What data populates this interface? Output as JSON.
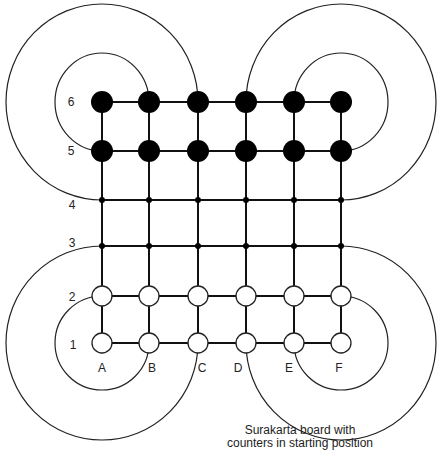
{
  "board": {
    "name": "Surakarta board",
    "columns": [
      "A",
      "B",
      "C",
      "D",
      "E",
      "F"
    ],
    "rows": [
      "1",
      "2",
      "3",
      "4",
      "5",
      "6"
    ],
    "black_rows": [
      "5",
      "6"
    ],
    "white_rows": [
      "1",
      "2"
    ],
    "empty_rows": [
      "3",
      "4"
    ],
    "colors": {
      "line": "#111111",
      "black_piece": "#000000",
      "white_piece": "#ffffff"
    }
  },
  "caption": {
    "line1": "Surakarta board with",
    "line2": "counters in starting position"
  }
}
